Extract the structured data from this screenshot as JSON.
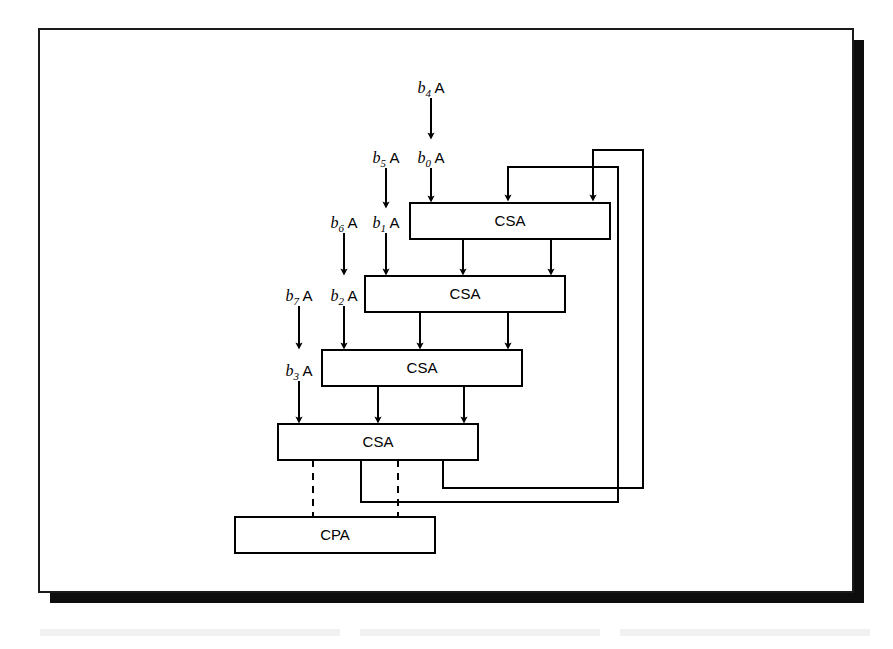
{
  "figure": {
    "frame": {
      "x": 39,
      "y": 29,
      "width": 814,
      "height": 563,
      "shadow_offset": 11
    }
  },
  "units": [
    {
      "id": "csa1",
      "label": "CSA",
      "x": 410,
      "y": 203,
      "width": 200,
      "height": 36
    },
    {
      "id": "csa2",
      "label": "CSA",
      "x": 365,
      "y": 276,
      "width": 200,
      "height": 36
    },
    {
      "id": "csa3",
      "label": "CSA",
      "x": 322,
      "y": 350,
      "width": 200,
      "height": 36
    },
    {
      "id": "csa4",
      "label": "CSA",
      "x": 278,
      "y": 424,
      "width": 200,
      "height": 36
    },
    {
      "id": "cpa",
      "label": "CPA",
      "x": 235,
      "y": 517,
      "width": 200,
      "height": 36
    }
  ],
  "inputs": [
    {
      "id": "b4A",
      "var": "b",
      "sub": "4",
      "operand": "A",
      "label_x": 431,
      "label_y": 88,
      "arrow_x": 431,
      "arrow_from": 98,
      "arrow_to": 136
    },
    {
      "id": "b5A",
      "var": "b",
      "sub": "5",
      "operand": "A",
      "label_x": 386,
      "label_y": 158,
      "arrow_x": 386,
      "arrow_from": 168,
      "arrow_to": 205
    },
    {
      "id": "b0A",
      "var": "b",
      "sub": "0",
      "operand": "A",
      "label_x": 431,
      "label_y": 158,
      "arrow_x": 431,
      "arrow_from": 168,
      "arrow_to": 202
    },
    {
      "id": "b6A",
      "var": "b",
      "sub": "6",
      "operand": "A",
      "label_x": 344,
      "label_y": 223,
      "arrow_x": 344,
      "arrow_from": 233,
      "arrow_to": 272
    },
    {
      "id": "b1A",
      "var": "b",
      "sub": "1",
      "operand": "A",
      "label_x": 386,
      "label_y": 223,
      "arrow_x": 386,
      "arrow_from": 233,
      "arrow_to": 275
    },
    {
      "id": "b7A",
      "var": "b",
      "sub": "7",
      "operand": "A",
      "label_x": 299,
      "label_y": 296,
      "arrow_x": 299,
      "arrow_from": 306,
      "arrow_to": 346
    },
    {
      "id": "b2A",
      "var": "b",
      "sub": "2",
      "operand": "A",
      "label_x": 344,
      "label_y": 296,
      "arrow_x": 344,
      "arrow_from": 306,
      "arrow_to": 349
    },
    {
      "id": "b3A",
      "var": "b",
      "sub": "3",
      "operand": "A",
      "label_x": 299,
      "label_y": 371,
      "arrow_x": 299,
      "arrow_from": 381,
      "arrow_to": 421
    }
  ],
  "internal_wires": [
    {
      "id": "csa1-sum-to-csa2",
      "x": 463,
      "from_y": 239,
      "to_y": 273
    },
    {
      "id": "csa1-carry-to-csa2",
      "x": 551,
      "from_y": 239,
      "to_y": 273
    },
    {
      "id": "csa2-sum-to-csa3",
      "x": 420,
      "from_y": 312,
      "to_y": 347
    },
    {
      "id": "csa2-carry-to-csa3",
      "x": 508,
      "from_y": 312,
      "to_y": 347
    },
    {
      "id": "csa3-sum-to-csa4",
      "x": 378,
      "from_y": 386,
      "to_y": 421
    },
    {
      "id": "csa3-carry-to-csa4",
      "x": 464,
      "from_y": 386,
      "to_y": 421
    }
  ],
  "feedback_loops": [
    {
      "id": "outer-feedback-loop",
      "description": "CSA4 carry output routed back to CSA1 right input",
      "points": "443,460 443,488 643,488 643,150 593,150 593,198",
      "arrow_x": 593,
      "arrow_y": 202
    },
    {
      "id": "inner-feedback-loop",
      "description": "CSA4 sum output routed back to CSA1 middle input",
      "points": "361,460 361,502 618,502 618,167 508,167 508,198",
      "arrow_x": 508,
      "arrow_y": 202
    }
  ],
  "dashed_connections": [
    {
      "id": "csa4-to-cpa-left",
      "x": 313,
      "from_y": 460,
      "to_y": 517
    },
    {
      "id": "csa4-to-cpa-right",
      "x": 398,
      "from_y": 460,
      "to_y": 517
    }
  ],
  "colors": {
    "line": "#000000",
    "frame": "#1a1a1a",
    "shadow": "#0d0d0d",
    "background": "#ffffff",
    "box_fill": "#ffffff"
  }
}
